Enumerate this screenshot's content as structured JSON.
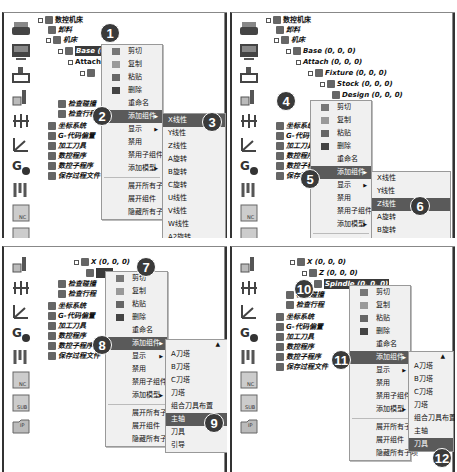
{
  "tree": {
    "root": "数控机床",
    "holder": "卸料",
    "bed": "机床",
    "base": "Base (0, 0, 0)",
    "attach": "Attach (0, 0, 0)",
    "fixture": "Fixture (0, 0, 0)",
    "stock": "Stock (0, 0, 0)",
    "design": "Design (0, 0, 0)",
    "x_axis": "X (0, 0, 0)",
    "z_axis": "Z (0, 0, 0)",
    "spindle": "Spindle (0, 0, 0)",
    "probe1": "检查碰撞",
    "probe2": "检查行程",
    "coord": "坐标系统",
    "gcode": "G-代码偏置",
    "tools": "加工刀具",
    "nc": "数控程序",
    "subnc": "数控子程序",
    "save": "保存过程文件"
  },
  "context_menu": {
    "cut": "剪切",
    "copy": "复制",
    "paste": "粘贴",
    "delete": "删除",
    "rename": "重命名",
    "add_component": "添加组件",
    "display": "显示",
    "disable": "禁用",
    "disable_children": "禁用子组件",
    "add_model": "添加模型",
    "expand_all": "展开所有子项",
    "expand_component": "展开组件",
    "hide_all": "隐藏所有子项"
  },
  "axis_submenu": [
    "X线性",
    "Y线性",
    "Z线性",
    "A旋转",
    "B旋转",
    "C旋转",
    "U线性",
    "V线性",
    "W线性",
    "A2旋转"
  ],
  "tool_submenu": [
    "A刀塔",
    "B刀塔",
    "C刀塔",
    "刀塔",
    "组合刀具布置",
    "主轴",
    "刀具",
    "引导"
  ],
  "callouts": [
    "1",
    "2",
    "3",
    "4",
    "5",
    "6",
    "7",
    "8",
    "9",
    "10",
    "11",
    "12"
  ],
  "toolbar_icons": [
    "printer",
    "monitor",
    "machine",
    "tool-holder",
    "axis-dim",
    "coordinate",
    "g-code",
    "tools",
    "nc-program",
    "sub-program",
    "save-file"
  ],
  "toolbar_labels": {
    "nc": "NC",
    "sub": "SUB",
    "ip": "IP"
  }
}
